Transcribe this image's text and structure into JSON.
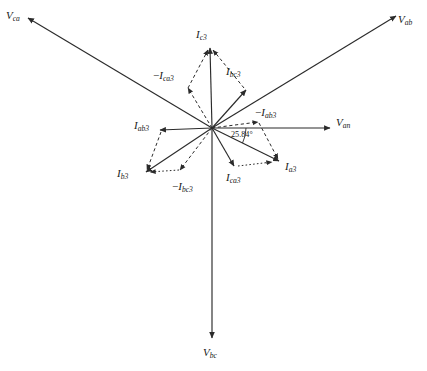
{
  "figure": {
    "background_color": "#ffffff",
    "stroke_color": "#2b2b2b",
    "width": 427,
    "height": 371
  },
  "origin": {
    "x": 212,
    "y": 128
  },
  "angle_annotation": {
    "text": "25.84°",
    "value": 25.84,
    "unit": "degrees",
    "from_label": "V_an",
    "to_label": "I_a3",
    "x": 231,
    "y": 130
  },
  "voltage_phasors": [
    {
      "name": "V_ca",
      "label_base": "V",
      "label_sub": "ca",
      "style": "solid",
      "angle_deg": 150,
      "tip": {
        "x": 28,
        "y": 18
      },
      "label_pos": {
        "x": 6,
        "y": 10
      }
    },
    {
      "name": "V_ab",
      "label_base": "V",
      "label_sub": "ab",
      "style": "solid",
      "angle_deg": 30,
      "tip": {
        "x": 396,
        "y": 16
      },
      "label_pos": {
        "x": 398,
        "y": 14
      }
    },
    {
      "name": "V_an",
      "label_base": "V",
      "label_sub": "an",
      "style": "solid",
      "angle_deg": 0,
      "tip": {
        "x": 330,
        "y": 128
      },
      "label_pos": {
        "x": 336,
        "y": 117
      }
    },
    {
      "name": "V_bc",
      "label_base": "V",
      "label_sub": "bc",
      "style": "solid",
      "angle_deg": 270,
      "tip": {
        "x": 212,
        "y": 338
      },
      "label_pos": {
        "x": 203,
        "y": 347
      }
    }
  ],
  "line_currents": [
    {
      "name": "I_c3",
      "label_base": "I",
      "label_sub": "c3",
      "style": "solid",
      "tip": {
        "x": 210,
        "y": 48
      },
      "label_pos": {
        "x": 196,
        "y": 29
      }
    },
    {
      "name": "I_b3",
      "label_base": "I",
      "label_sub": "b3",
      "style": "solid",
      "tip": {
        "x": 146,
        "y": 172
      },
      "label_pos": {
        "x": 117,
        "y": 168
      }
    },
    {
      "name": "I_a3",
      "label_base": "I",
      "label_sub": "a3",
      "style": "solid",
      "tip": {
        "x": 279,
        "y": 161
      },
      "label_pos": {
        "x": 285,
        "y": 161
      }
    }
  ],
  "phase_currents": [
    {
      "name": "I_ab3",
      "label_base": "I",
      "label_sub": "ab3",
      "style": "solid",
      "tip": {
        "x": 160,
        "y": 130
      },
      "label_pos": {
        "x": 134,
        "y": 120
      }
    },
    {
      "name": "I_bc3",
      "label_base": "I",
      "label_sub": "bc3",
      "style": "solid",
      "tip": {
        "x": 246,
        "y": 90
      },
      "label_pos": {
        "x": 226,
        "y": 66
      }
    },
    {
      "name": "I_ca3",
      "label_base": "I",
      "label_sub": "ca3",
      "style": "solid",
      "tip": {
        "x": 234,
        "y": 166
      },
      "label_pos": {
        "x": 226,
        "y": 172
      }
    }
  ],
  "negated_currents": [
    {
      "name": "-I_ca3",
      "label_prefix": "−",
      "label_base": "I",
      "label_sub": "ca3",
      "style": "dashed",
      "tip": {
        "x": 188,
        "y": 88
      },
      "label_pos": {
        "x": 153,
        "y": 70
      }
    },
    {
      "name": "-I_ab3",
      "label_prefix": "−",
      "label_base": "I",
      "label_sub": "ab3",
      "style": "dashed",
      "tip": {
        "x": 258,
        "y": 122
      },
      "label_pos": {
        "x": 255,
        "y": 107
      }
    },
    {
      "name": "-I_bc3",
      "label_prefix": "−",
      "label_base": "I",
      "label_sub": "bc3",
      "style": "dashed",
      "tip": {
        "x": 180,
        "y": 170
      },
      "label_pos": {
        "x": 172,
        "y": 181
      }
    }
  ],
  "construction_segments": [
    {
      "name": "seg-ica3-to-ic3",
      "style": "dashed",
      "from": {
        "x": 188,
        "y": 88
      },
      "to": {
        "x": 208,
        "y": 50
      }
    },
    {
      "name": "seg-ibc3-to-ic3",
      "style": "dashed",
      "from": {
        "x": 244,
        "y": 88
      },
      "to": {
        "x": 213,
        "y": 50
      }
    },
    {
      "name": "seg-iab3-to-ib3",
      "style": "dashed",
      "from": {
        "x": 161,
        "y": 132
      },
      "to": {
        "x": 147,
        "y": 170
      }
    },
    {
      "name": "seg-ibc3neg-to-ib3",
      "style": "dotted",
      "from": {
        "x": 179,
        "y": 170
      },
      "to": {
        "x": 150,
        "y": 172
      }
    },
    {
      "name": "seg-iab3neg-to-ia3",
      "style": "dashed",
      "from": {
        "x": 259,
        "y": 123
      },
      "to": {
        "x": 278,
        "y": 159
      }
    },
    {
      "name": "seg-ica3-to-ia3",
      "style": "dotted",
      "from": {
        "x": 238,
        "y": 166
      },
      "to": {
        "x": 272,
        "y": 162
      }
    }
  ]
}
